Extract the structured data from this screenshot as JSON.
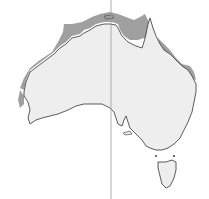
{
  "map": {
    "region": "Australia",
    "colors": {
      "background": "#ffffff",
      "land": "#eeeeee",
      "shaded": "#a0a0a0",
      "coastline": "#333333",
      "meridian": "#999999"
    },
    "meridian_x": 111,
    "shaded_regions": [
      "north-west-coast",
      "top-end",
      "gulf-of-carpentaria",
      "cape-york",
      "queensland-east-coast",
      "west-coast"
    ]
  }
}
